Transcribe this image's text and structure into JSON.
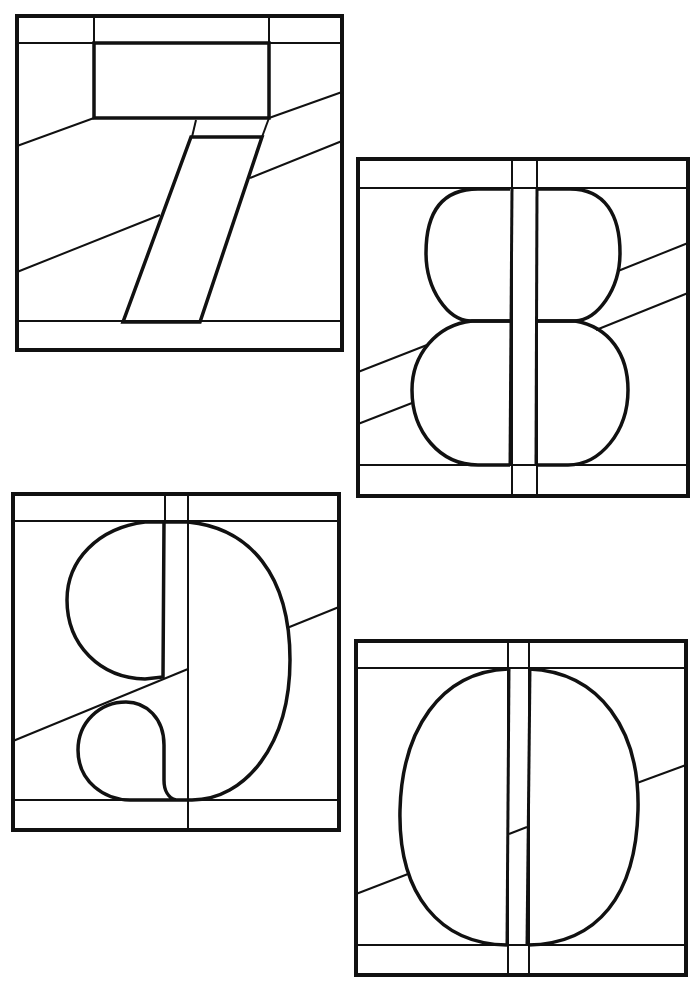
{
  "page": {
    "kind": "coloring-page",
    "theme": "stained-glass digits",
    "background": "#ffffff",
    "ink": "#111111"
  },
  "panels": [
    {
      "digit": "7",
      "position": "top-left"
    },
    {
      "digit": "8",
      "position": "upper-right"
    },
    {
      "digit": "9",
      "position": "lower-left"
    },
    {
      "digit": "0",
      "position": "bottom-right"
    }
  ]
}
